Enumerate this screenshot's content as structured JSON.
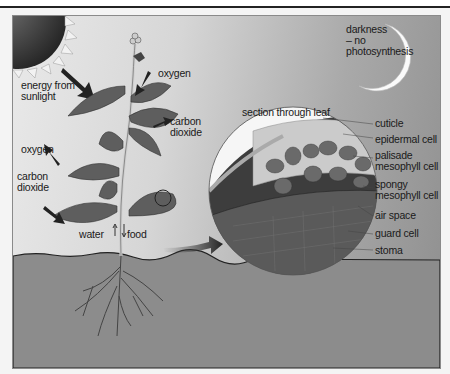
{
  "diagram": {
    "title": "Photosynthesis",
    "labels": {
      "energy": "energy from\nsunlight",
      "darkness": "darkness\n– no\nphotosynthesis",
      "oxygen_top": "oxygen",
      "oxygen_left": "oxygen",
      "co2_right": "carbon\ndioxide",
      "co2_left": "carbon\ndioxide",
      "water": "water",
      "food": "food",
      "section": "section through leaf"
    },
    "leaf_section_labels": [
      "cuticle",
      "epidermal cell",
      "palisade\nmesophyll cell",
      "spongy\nmesophyll cell",
      "air space",
      "guard cell",
      "stoma"
    ],
    "colors": {
      "sky_light": "#e9e9e9",
      "sky_dark": "#8f8f8f",
      "soil": "#8c8c8c",
      "leaf": "#5e5e5e",
      "sun": "#3a3a3a"
    }
  }
}
